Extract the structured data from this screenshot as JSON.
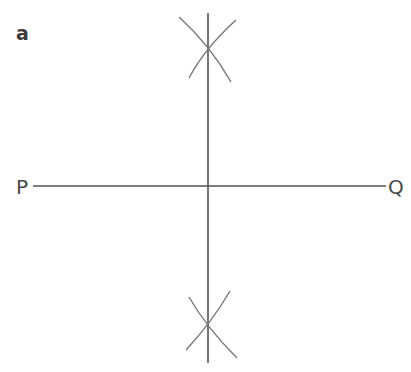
{
  "diagram": {
    "part_label": "a",
    "points": {
      "left": "P",
      "right": "Q"
    },
    "colors": {
      "line": "#555555",
      "arc": "#777777",
      "text": "#444444"
    }
  }
}
